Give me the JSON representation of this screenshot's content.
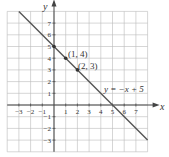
{
  "chart_data": {
    "type": "line",
    "title": "",
    "xlabel": "x",
    "ylabel": "y",
    "xlim": [
      -4,
      8
    ],
    "ylim": [
      -4,
      8
    ],
    "grid": true,
    "x_ticks": [
      "-3",
      "-2",
      "-1",
      "1",
      "2",
      "3",
      "4",
      "5",
      "6",
      "7"
    ],
    "y_ticks": [
      "7",
      "6",
      "5",
      "4",
      "3",
      "2",
      "1",
      "-1",
      "-2",
      "-3"
    ],
    "series": [
      {
        "name": "y = -x + 5",
        "x": [
          -3,
          8
        ],
        "y": [
          8,
          -3
        ]
      }
    ],
    "points": [
      {
        "x": 0,
        "y": 5,
        "label": ""
      },
      {
        "x": 1,
        "y": 4,
        "label": "(1, 4)"
      },
      {
        "x": 2,
        "y": 3,
        "label": "(2, 3)"
      }
    ],
    "annotations": [
      {
        "text": "y = −x + 5",
        "x": 5,
        "y": 1.8
      }
    ]
  },
  "labels": {
    "x_axis": "x",
    "y_axis": "y",
    "equation": "y = −x + 5",
    "p1": "(1, 4)",
    "p2": "(2, 3)"
  }
}
